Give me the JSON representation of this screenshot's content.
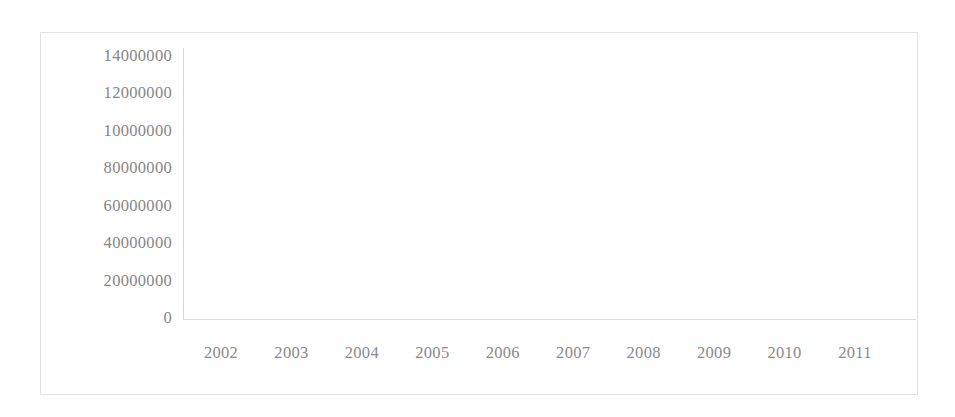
{
  "chart_data": {
    "type": "line",
    "title": "",
    "subtitle": "",
    "xlabel": "",
    "ylabel": "",
    "grid": false,
    "legend": false,
    "legend_position": "none",
    "markers": false,
    "line_color": "#6e6e6e",
    "categories": [
      "2002",
      "2003",
      "2004",
      "2005",
      "2006",
      "2007",
      "2008",
      "2009",
      "2010",
      "2011"
    ],
    "x": [
      2002,
      2003,
      2004,
      2005,
      2006,
      2007,
      2008,
      2009,
      2010,
      2011
    ],
    "values": [
      7500000,
      6500000,
      6200000,
      5250000,
      8900000,
      7900000,
      6000000,
      11800000,
      12200000,
      12400000
    ],
    "ylim": [
      0,
      14000000
    ],
    "ytick_values": [
      14000000,
      12000000,
      10000000,
      8000000,
      6000000,
      4000000,
      2000000,
      0
    ],
    "ytick_labels": [
      "14000000",
      "12000000",
      "10000000",
      "80000000",
      "60000000",
      "40000000",
      "20000000",
      "0"
    ],
    "xtick_labels": [
      "2002",
      "2003",
      "2004",
      "2005",
      "2006",
      "2007",
      "2008",
      "2009",
      "2010",
      "2011"
    ],
    "series": [
      {
        "name": "",
        "values": [
          7500000,
          6500000,
          6200000,
          5250000,
          8900000,
          7900000,
          6000000,
          11800000,
          12200000,
          12400000
        ]
      }
    ],
    "annotations": []
  },
  "figure": {
    "frame_color": "#e3e3e3",
    "axis_color": "#d8d8d8",
    "tick_label_color": "#878787",
    "background": "#ffffff"
  }
}
